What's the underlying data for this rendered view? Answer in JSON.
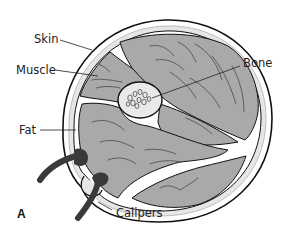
{
  "figure": {
    "panel_label": "A"
  },
  "labels": {
    "skin": "Skin",
    "muscle": "Muscle",
    "fat": "Fat",
    "bone": "Bone",
    "calipers": "Calipers"
  },
  "colors": {
    "muscle": "#a9a9a9",
    "fat": "#e6e6e6",
    "bone": "#e9e9e9",
    "outline": "#111111",
    "caliper": "#3a3a3a"
  }
}
